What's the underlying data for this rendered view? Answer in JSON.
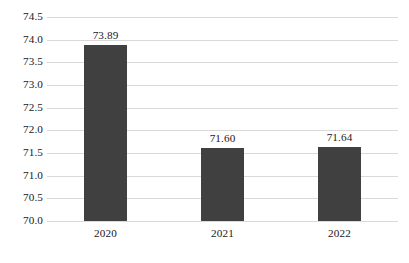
{
  "chart_data": {
    "type": "bar",
    "title": "",
    "subtitle": "",
    "xlabel": "",
    "ylabel": "",
    "categories": [
      "2020",
      "2021",
      "2022"
    ],
    "values": [
      73.89,
      71.6,
      71.64
    ],
    "data_labels": [
      "73.89",
      "71.60",
      "71.64"
    ],
    "series": [
      {
        "name": "",
        "values": [
          73.89,
          71.6,
          71.64
        ]
      }
    ],
    "ylim": [
      70.0,
      74.5
    ],
    "ytick_step": 0.5,
    "ytick_labels": [
      "74.5",
      "74.0",
      "73.5",
      "73.0",
      "72.5",
      "72.0",
      "71.5",
      "71.0",
      "70.5",
      "70.0"
    ],
    "ytick_values": [
      74.5,
      74.0,
      73.5,
      73.0,
      72.5,
      72.0,
      71.5,
      71.0,
      70.5,
      70.0
    ],
    "grid": {
      "horizontal": true,
      "vertical": false,
      "color": "#d9d9d9"
    },
    "legend": {
      "visible": false,
      "position": "none",
      "entries": []
    },
    "colors": {
      "bar": "#404040",
      "gridline": "#d9d9d9",
      "text": "#1a1a1a",
      "background": "#ffffff"
    },
    "annotations": []
  }
}
